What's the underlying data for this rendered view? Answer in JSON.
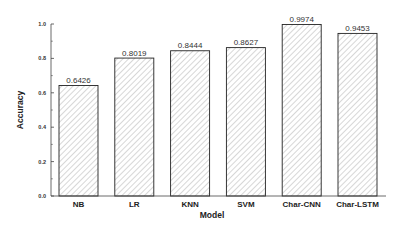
{
  "chart_data": {
    "type": "bar",
    "title": "",
    "xlabel": "Model",
    "ylabel": "Accuracy",
    "categories": [
      "NB",
      "LR",
      "KNN",
      "SVM",
      "Char-CNN",
      "Char-LSTM"
    ],
    "values": [
      0.6426,
      0.8019,
      0.8444,
      0.8627,
      0.9974,
      0.9453
    ],
    "value_labels": [
      "0.6426",
      "0.8019",
      "0.8444",
      "0.8627",
      "0.9974",
      "0.9453"
    ],
    "ylim": [
      0.0,
      1.0
    ],
    "yticks": [
      "0.0",
      "0.2",
      "0.4",
      "0.6",
      "0.8",
      "1.0"
    ],
    "grid": false,
    "legend": null,
    "bar_fill": "hatched diagonal",
    "colors": {
      "bar_edge": "#222222",
      "hatch": "#9a9a9a",
      "axis": "#444444"
    }
  }
}
